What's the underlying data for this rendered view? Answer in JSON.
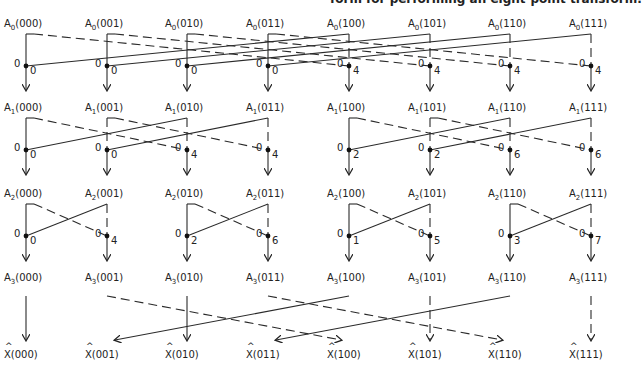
{
  "caption": "form for performing an eight-point transform.",
  "stages": [
    {
      "name": "A0",
      "prefix": "A",
      "sub": "0",
      "y": 18,
      "nodes": [
        "000",
        "001",
        "010",
        "011",
        "100",
        "101",
        "110",
        "111"
      ]
    },
    {
      "name": "A1",
      "prefix": "A",
      "sub": "1",
      "y": 102,
      "nodes": [
        "000",
        "001",
        "010",
        "011",
        "100",
        "101",
        "110",
        "111"
      ]
    },
    {
      "name": "A2",
      "prefix": "A",
      "sub": "2",
      "y": 188,
      "nodes": [
        "000",
        "001",
        "010",
        "011",
        "100",
        "101",
        "110",
        "111"
      ]
    },
    {
      "name": "A3",
      "prefix": "A",
      "sub": "3",
      "y": 272,
      "nodes": [
        "000",
        "001",
        "010",
        "011",
        "100",
        "101",
        "110",
        "111"
      ]
    }
  ],
  "outputs": {
    "prefix": "X",
    "hat": "^",
    "nodes": [
      "000",
      "001",
      "010",
      "011",
      "100",
      "101",
      "110",
      "111"
    ]
  },
  "weights": {
    "stage1": {
      "left": [
        "0",
        "0",
        "0",
        "0",
        "0",
        "0",
        "0",
        "0"
      ],
      "right": [
        "0",
        "0",
        "0",
        "0",
        "4",
        "4",
        "4",
        "4"
      ]
    },
    "stage2": {
      "left": [
        "0",
        "0",
        "0",
        "0",
        "0",
        "0",
        "0",
        "0"
      ],
      "right": [
        "0",
        "0",
        "4",
        "4",
        "2",
        "2",
        "6",
        "6"
      ]
    },
    "stage3": {
      "left": [
        "0",
        "0",
        "0",
        "0",
        "0",
        "0",
        "0",
        "0"
      ],
      "right": [
        "0",
        "4",
        "2",
        "6",
        "1",
        "5",
        "3",
        "7"
      ]
    }
  },
  "bit_reversal": [
    {
      "from": "000",
      "to": "000"
    },
    {
      "from": "001",
      "to": "100"
    },
    {
      "from": "010",
      "to": "010"
    },
    {
      "from": "011",
      "to": "110"
    },
    {
      "from": "100",
      "to": "001"
    },
    {
      "from": "101",
      "to": "101"
    },
    {
      "from": "110",
      "to": "011"
    },
    {
      "from": "111",
      "to": "111"
    }
  ],
  "legend": {
    "solid": "solid line",
    "dashed": "dashed line"
  }
}
